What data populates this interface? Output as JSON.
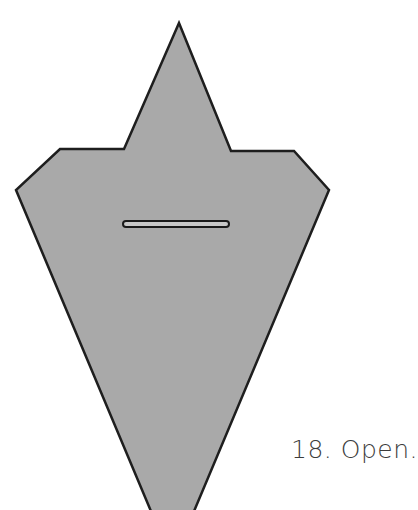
{
  "figure": {
    "step_label": "18. Open.",
    "shape": {
      "name": "folded-paper-shape",
      "fill": "#a9a9a9",
      "stroke": "#1e1e1e",
      "vertices": [
        [
          179,
          23
        ],
        [
          231,
          151
        ],
        [
          294,
          151
        ],
        [
          329,
          190
        ],
        [
          190,
          510
        ],
        [
          155,
          510
        ],
        [
          16,
          190
        ],
        [
          60,
          149
        ],
        [
          124,
          149
        ]
      ]
    },
    "slot": {
      "x": 123,
      "y": 221,
      "width": 106,
      "height": 6,
      "fill": "#c8c8c8",
      "stroke": "#1a1a1a"
    }
  }
}
